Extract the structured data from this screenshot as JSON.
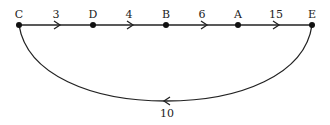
{
  "diagram": {
    "type": "directed-graph",
    "nodes": [
      {
        "id": "C",
        "label": "C",
        "x": 19,
        "y": 25
      },
      {
        "id": "D",
        "label": "D",
        "x": 93,
        "y": 25
      },
      {
        "id": "B",
        "label": "B",
        "x": 166,
        "y": 25
      },
      {
        "id": "A",
        "label": "A",
        "x": 238,
        "y": 25
      },
      {
        "id": "E",
        "label": "E",
        "x": 312,
        "y": 25
      }
    ],
    "edges": [
      {
        "from": "C",
        "to": "D",
        "weight": "3"
      },
      {
        "from": "D",
        "to": "B",
        "weight": "4"
      },
      {
        "from": "B",
        "to": "A",
        "weight": "6"
      },
      {
        "from": "A",
        "to": "E",
        "weight": "15"
      },
      {
        "from": "E",
        "to": "C",
        "weight": "10",
        "shape": "curved-below"
      }
    ],
    "colors": {
      "line": "#222222",
      "node": "#111111",
      "text": "#222222"
    }
  }
}
